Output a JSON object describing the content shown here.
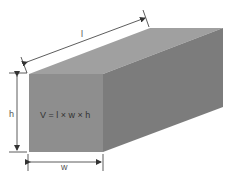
{
  "diagram": {
    "formula": "V = l × w × h",
    "labels": {
      "length": "l",
      "width": "w",
      "height": "h"
    },
    "colors": {
      "top_face": "#a0a0a0",
      "front_face": "#8e8e8e",
      "side_face": "#7c7c7c",
      "dimension_lines": "#333333"
    }
  }
}
